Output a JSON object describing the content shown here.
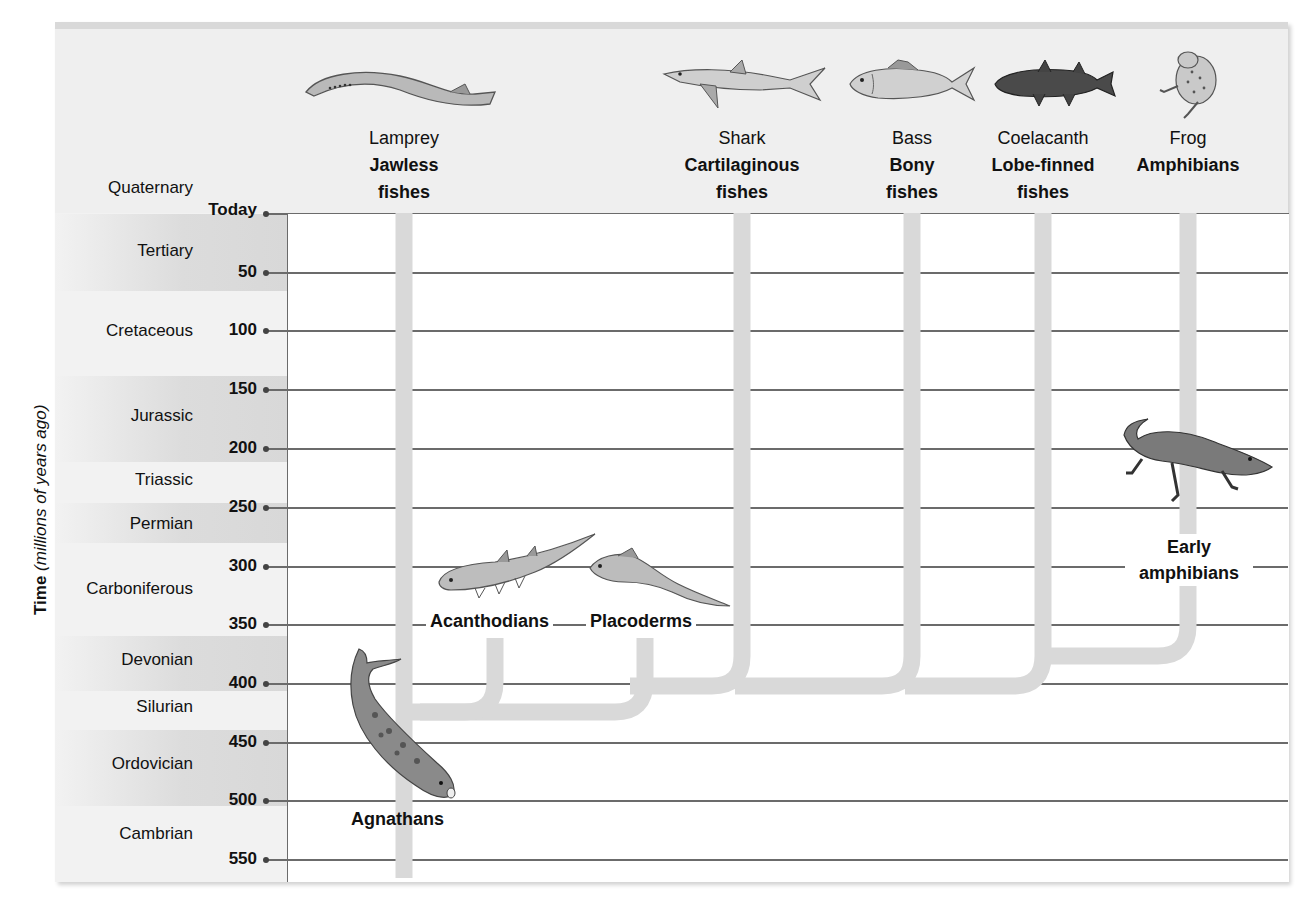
{
  "axis": {
    "title_bold": "Time",
    "title_italic": "(millions of years ago)"
  },
  "ticks": [
    "Today",
    "50",
    "100",
    "150",
    "200",
    "250",
    "300",
    "350",
    "400",
    "450",
    "500",
    "550"
  ],
  "periods": [
    {
      "name": "Quaternary"
    },
    {
      "name": "Tertiary"
    },
    {
      "name": "Cretaceous"
    },
    {
      "name": "Jurassic"
    },
    {
      "name": "Triassic"
    },
    {
      "name": "Permian"
    },
    {
      "name": "Carboniferous"
    },
    {
      "name": "Devonian"
    },
    {
      "name": "Silurian"
    },
    {
      "name": "Ordovician"
    },
    {
      "name": "Cambrian"
    }
  ],
  "living_taxa": [
    {
      "common": "Lamprey",
      "group_line1": "Jawless",
      "group_line2": "fishes"
    },
    {
      "common": "Shark",
      "group_line1": "Cartilaginous",
      "group_line2": "fishes"
    },
    {
      "common": "Bass",
      "group_line1": "Bony",
      "group_line2": "fishes"
    },
    {
      "common": "Coelacanth",
      "group_line1": "Lobe-finned",
      "group_line2": "fishes"
    },
    {
      "common": "Frog",
      "group_line1": "Amphibians",
      "group_line2": ""
    }
  ],
  "fossil_taxa": {
    "acanthodians": "Acanthodians",
    "placoderms": "Placoderms",
    "agnathans": "Agnathans",
    "early_amphibians_line1": "Early",
    "early_amphibians_line2": "amphibians"
  },
  "colors": {
    "branch": "#d9d9d9",
    "grid": "#6b6b6b",
    "header_bg": "#efefef",
    "band_dark": "#d8d8d8"
  }
}
